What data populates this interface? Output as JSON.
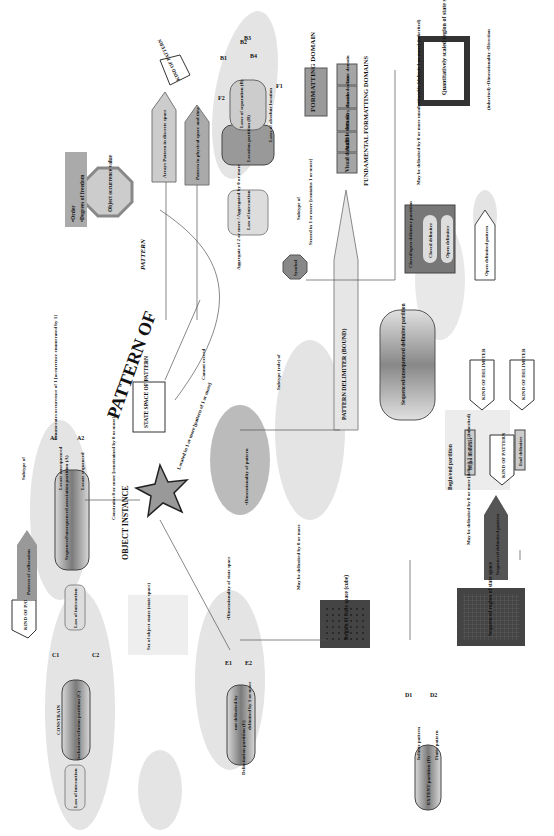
{
  "title": "FUNDAMENTAL FORMATTING DOMAINS",
  "formatting": {
    "root": "FORMATTING DOMAIN",
    "domains": [
      "Visual domain",
      "Audible domain",
      "Olfactory domain",
      "Tactile domain",
      "Taste domain"
    ]
  },
  "core": {
    "object_instance": "OBJECT INSTANCE",
    "pattern_of": "PATTERN OF",
    "pattern": "PATTERN",
    "state_space": "STATE SPACE OF PATTERN",
    "object_occurrence_value": "Object occurrence value",
    "order_dof": [
      "•Order",
      "•Degrees of freedom"
    ],
    "symbol": "Symbol",
    "pattern_delimiter": "PATTERN DELIMITER (BOUND)",
    "dimensionality_note": [
      "•Dimensionality of pattern",
      "•Direction(s) in pattern",
      "•Aggregate statistics about location and separation of components (e.g. variance of separations)"
    ],
    "cannot_exceed": "Cannot exceed",
    "dim_of_pattern": "Dimensionality (of pattern)",
    "dim_of_state_space": "Dimensionality (of state space)",
    "object_state": "Object State",
    "set_of_object_states": [
      "Set of object states (state space)",
      "•Dimensionality",
      "•Direction"
    ],
    "dim_state_space_note": "•Dimensionality of state space"
  },
  "relations": {
    "enumerates": "Enumerates occurrence of 1 [occurrence enumerated by 1]",
    "subtype_of": "Subtype of",
    "subtype_role_of": "Subtype (role) of",
    "constrains": "Constrains 0 or more [constrained by 0 or more]",
    "contained_in": "Contained in 0 or more [contained in 0 or more] (implied)",
    "located_in": "Located in 1 or more [pattern of 1 or more]",
    "set_of": "Set of 0 or more [in 1 or more]",
    "held_in": "held in 1 or more [holds 0 or more]",
    "aggregate": "Aggregate of 2 or more / Aggregated by 0 or more",
    "sensed_in": "Sensed in 1 or more [contains 1 or more]",
    "pattern_of_delim": "pattern of 1 or more [be contained in 0 or more]",
    "partition_of": "partition of [partitioned by]",
    "may_be_delimited": "May be delimited by 0 or more",
    "may_be_delimited_unsub": "May be delimited by 0 or more unsubstitutable [delimit 1 or more] (inherited)",
    "may_be_delimited_inh": "May be delimited by 0 or more [delimit 1 or more] (inherited)",
    "inherited": "(inherited) •Dimensionality •Direction"
  },
  "partitions": {
    "A": {
      "name": "Sequenced/unsequenced association partition (A)",
      "branches": [
        "Locate unsequenced",
        "Locate sequenced"
      ],
      "tags": [
        "A1",
        "A2"
      ]
    },
    "B": {
      "name": "Location partition (B)",
      "inner": "Laws of separation (B)",
      "branches": [
        "Laws of absolute location"
      ],
      "tags": [
        "B1",
        "B2",
        "B3",
        "B4"
      ]
    },
    "C": {
      "name": "Inclusion/exclusion partition (C)",
      "label": "CONSTRAIN",
      "branches": [
        "Include region of",
        "Exclude region of"
      ],
      "tags": [
        "C1",
        "C2"
      ]
    },
    "D": {
      "name": "EXTENT partition (D)",
      "branches": [
        "Infinite pattern",
        "Finite pattern"
      ],
      "tags": [
        "D1",
        "D2"
      ]
    },
    "E": {
      "name": "Delimitation partition (E)",
      "branches": [
        "not delimited by",
        "delimited by 1 or more"
      ],
      "tags": [
        "E1",
        "E2"
      ]
    },
    "F": {
      "tags": [
        "F1",
        "F2"
      ]
    }
  },
  "law_of_interaction": "Law of interaction",
  "kind_of_pattern": "KIND OF PATTERN",
  "kind_of_delimiter": "KIND OF DELIMITER",
  "patterns": {
    "collocation": "Pattern of collocation",
    "arrays": "Arrays Pattern in discrete space",
    "physical": "Pattern in physical space and time",
    "open_delimited": "Open delimited pattern",
    "sequenced_delimited": "Sequenced delimited pattern"
  },
  "delimiters": {
    "closed_open_partition": "Closed/open delimiter partition",
    "closed": "Closed delimiter",
    "open": "Open delimiter",
    "seq_unseq_partition": "Sequenced/unsequenced delimiter partition",
    "sequenced": "Sequenced pattern delimiter",
    "unsequenced": "Unsequenced pattern delimiter",
    "begin_pattern": "Begin pattern delimiter",
    "end_pattern": "End pattern delimiter",
    "begin_end_partition": "Begin/end partition",
    "begin": "Begin delimiter",
    "end": "End delimiter"
  },
  "regions": {
    "region": "Region of state space (cube)",
    "sequenced": "Sequenced region of state space",
    "quantitative": "Quantitatively scaled region of state space"
  }
}
